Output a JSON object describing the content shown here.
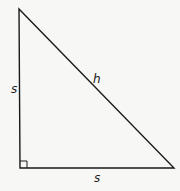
{
  "diagram": {
    "type": "right-triangle",
    "vertices": {
      "top": [
        19,
        9
      ],
      "right_angle": [
        20,
        168
      ],
      "bottom_right": [
        174,
        168
      ]
    },
    "labels": {
      "left_leg": "s",
      "hypotenuse": "h",
      "bottom_leg": "s"
    },
    "right_angle_marker": true,
    "colors": {
      "stroke": "#1a1a1a",
      "background": "#f7f7f5"
    }
  }
}
